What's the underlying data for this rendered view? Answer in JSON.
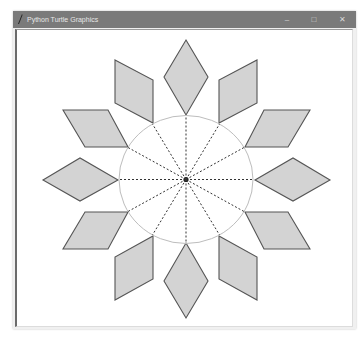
{
  "window": {
    "title": "Python Turtle Graphics",
    "app_icon": "feather-icon",
    "controls": {
      "minimize": {
        "icon": "minimize-icon",
        "glyph": "–"
      },
      "maximize": {
        "icon": "maximize-icon",
        "glyph": "□"
      },
      "close": {
        "icon": "close-icon",
        "glyph": "✕"
      }
    }
  },
  "drawing": {
    "description": "Twelve rhombi arranged radially around a circle with dashed spokes",
    "rhombus_count": 12,
    "spoke_count": 12,
    "colors": {
      "rhombus_fill": "#d3d3d3",
      "rhombus_stroke": "#555555",
      "circle_stroke": "#bdbdbd",
      "spoke_stroke": "#333333",
      "background": "#ffffff"
    }
  }
}
